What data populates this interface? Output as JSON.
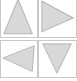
{
  "figure": {
    "title": "",
    "width": 77,
    "height": 81,
    "background_color": "#ffffff",
    "layout": {
      "rows": 2,
      "columns": 2,
      "panel_border_color": "#c9c9c9",
      "panel_border_width": 1,
      "top_row_cropped": true
    },
    "shape_style": {
      "fill_color": "#d8d8d8",
      "stroke_color": "#b4b4b4",
      "stroke_width": 1
    },
    "panels": [
      {
        "name": "panel-top-left",
        "shape": "triangle",
        "direction": "up",
        "points": "18,2 33,35 3,35"
      },
      {
        "name": "panel-top-right",
        "shape": "triangle",
        "direction": "left",
        "points": "36,20 3,4 3,33"
      },
      {
        "name": "panel-bottom-left",
        "shape": "triangle",
        "direction": "left",
        "points": "35,5 2,18 33,32"
      },
      {
        "name": "panel-bottom-right",
        "shape": "triangle",
        "direction": "down",
        "points": "4,3 34,3 19,34"
      }
    ]
  }
}
